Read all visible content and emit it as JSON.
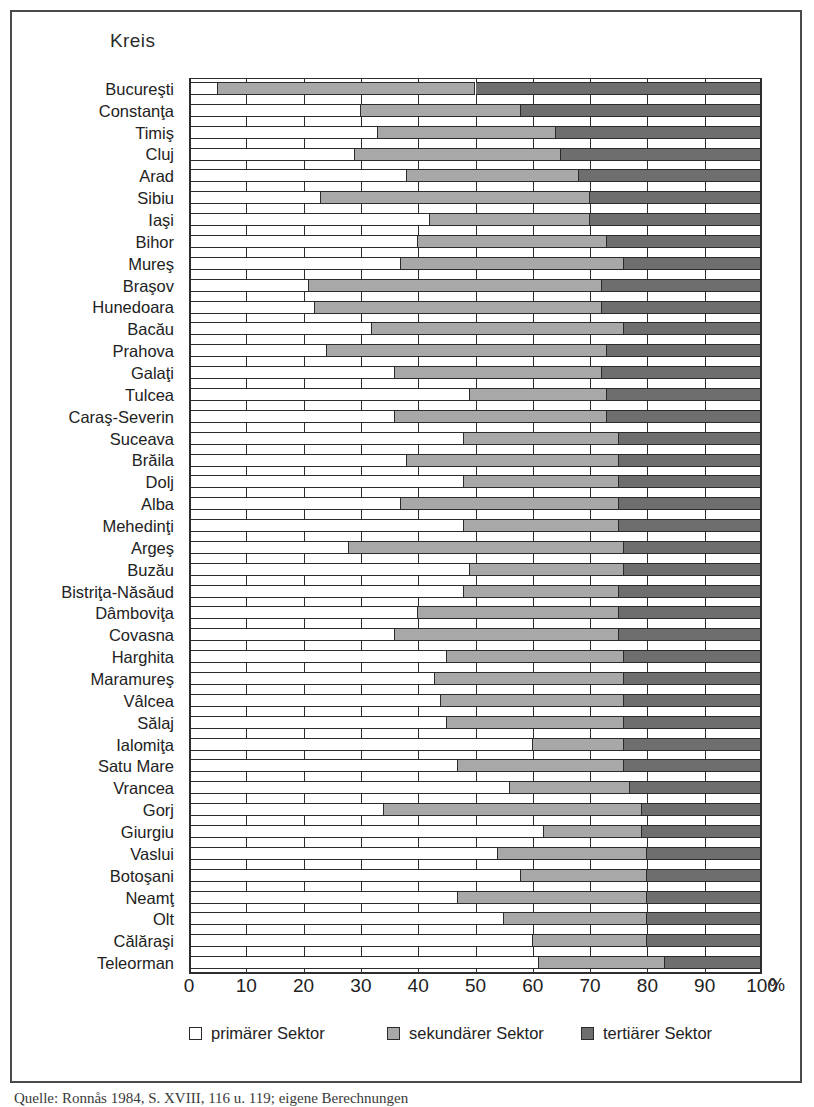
{
  "figure": {
    "title": "Kreis",
    "x_unit": "%",
    "source_caption": "Quelle: Ronnås 1984, S. XVIII, 116 u. 119; eigene Berechnungen"
  },
  "legend": {
    "position": "bottom",
    "items": [
      {
        "key": "primary",
        "label": "primärer Sektor",
        "color": "#ffffff"
      },
      {
        "key": "secondary",
        "label": "sekundärer Sektor",
        "color": "#a8a8a8"
      },
      {
        "key": "tertiary",
        "label": "tertiärer Sektor",
        "color": "#6e6e6e"
      }
    ]
  },
  "chart_data": {
    "type": "bar",
    "orientation": "horizontal",
    "stacked": true,
    "normalized": true,
    "title": "Kreis",
    "xlabel": "%",
    "ylabel": "Kreis",
    "xlim": [
      0,
      100
    ],
    "xticks": [
      0,
      10,
      20,
      30,
      40,
      50,
      60,
      70,
      80,
      90,
      100
    ],
    "xtick_labels": [
      "0",
      "10",
      "20",
      "30",
      "40",
      "50",
      "60",
      "70",
      "80",
      "90",
      "100"
    ],
    "grid": true,
    "legend_position": "bottom",
    "categories": [
      "Bucureşti",
      "Constanţa",
      "Timiş",
      "Cluj",
      "Arad",
      "Sibiu",
      "Iaşi",
      "Bihor",
      "Mureş",
      "Braşov",
      "Hunedoara",
      "Bacău",
      "Prahova",
      "Galaţi",
      "Tulcea",
      "Caraş-Severin",
      "Suceava",
      "Brăila",
      "Dolj",
      "Alba",
      "Mehedinţi",
      "Argeş",
      "Buzău",
      "Bistriţa-Năsăud",
      "Dâmboviţa",
      "Covasna",
      "Harghita",
      "Maramureş",
      "Vâlcea",
      "Sălaj",
      "Ialomiţa",
      "Satu Mare",
      "Vrancea",
      "Gorj",
      "Giurgiu",
      "Vaslui",
      "Botoşani",
      "Neamţ",
      "Olt",
      "Călăraşi",
      "Teleorman"
    ],
    "series": [
      {
        "name": "primärer Sektor",
        "color": "#ffffff",
        "values": [
          5,
          30,
          33,
          29,
          38,
          23,
          42,
          40,
          37,
          21,
          22,
          32,
          24,
          36,
          49,
          36,
          48,
          38,
          48,
          37,
          48,
          28,
          49,
          48,
          40,
          36,
          45,
          43,
          44,
          45,
          60,
          47,
          56,
          34,
          62,
          54,
          58,
          47,
          55,
          60,
          61
        ]
      },
      {
        "name": "sekundärer Sektor",
        "color": "#a8a8a8",
        "values": [
          45,
          28,
          31,
          36,
          30,
          47,
          28,
          33,
          39,
          51,
          50,
          44,
          49,
          36,
          24,
          37,
          27,
          37,
          27,
          38,
          27,
          48,
          27,
          27,
          35,
          39,
          31,
          33,
          32,
          31,
          16,
          29,
          21,
          45,
          17,
          26,
          22,
          33,
          25,
          20,
          22
        ]
      },
      {
        "name": "tertiärer Sektor",
        "color": "#6e6e6e",
        "values": [
          50,
          42,
          36,
          35,
          32,
          30,
          30,
          27,
          24,
          28,
          28,
          24,
          27,
          28,
          27,
          27,
          25,
          25,
          25,
          25,
          25,
          24,
          24,
          25,
          25,
          25,
          24,
          24,
          24,
          24,
          24,
          24,
          23,
          21,
          21,
          20,
          20,
          20,
          20,
          20,
          17
        ]
      }
    ]
  }
}
